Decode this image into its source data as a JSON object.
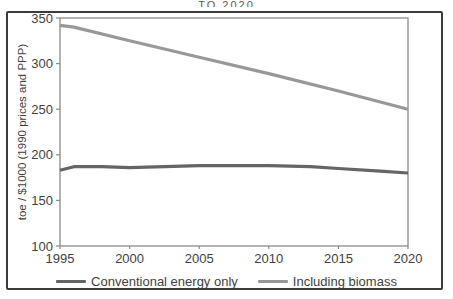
{
  "figure": {
    "top_caption_fragment": "TO 2020"
  },
  "colors": {
    "frame_border": "#3b3b3b",
    "plot_border": "#8a8a8a",
    "tick_text": "#3f3f3f",
    "background": "#ffffff"
  },
  "chart_data": {
    "type": "line",
    "title": "",
    "xlabel": "",
    "ylabel": "toe / $1000 (1990 prices and PPP)",
    "xlim": [
      1995,
      2020
    ],
    "ylim": [
      100,
      350
    ],
    "x_ticks": [
      1995,
      2000,
      2005,
      2010,
      2015,
      2020
    ],
    "y_ticks": [
      100,
      150,
      200,
      250,
      300,
      350
    ],
    "grid": false,
    "legend_position": "bottom",
    "series": [
      {
        "name": "Conventional energy only",
        "color": "#646567",
        "x": [
          1995,
          1996,
          1998,
          2000,
          2005,
          2008,
          2010,
          2013,
          2015,
          2018,
          2020
        ],
        "y": [
          183,
          187,
          187,
          186,
          188,
          188,
          188,
          187,
          185,
          182,
          180
        ]
      },
      {
        "name": "Including biomass",
        "color": "#96989a",
        "x": [
          1995,
          1996,
          2000,
          2005,
          2010,
          2015,
          2020
        ],
        "y": [
          342,
          340,
          325,
          307,
          289,
          270,
          250
        ]
      }
    ]
  }
}
